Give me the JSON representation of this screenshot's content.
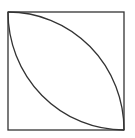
{
  "diagram": {
    "type": "geometry",
    "shapes": [
      {
        "kind": "square",
        "label": ""
      },
      {
        "kind": "quarter-circle-arc",
        "center": "bottom-left"
      },
      {
        "kind": "quarter-circle-arc",
        "center": "top-right"
      }
    ],
    "colors": {
      "stroke": "#333333",
      "background": "#ffffff"
    }
  }
}
